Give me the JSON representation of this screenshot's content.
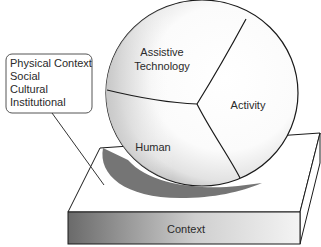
{
  "diagram": {
    "sphere_segments": [
      {
        "id": "assistive-technology",
        "label_lines": [
          "Assistive",
          "Technology"
        ]
      },
      {
        "id": "activity",
        "label_lines": [
          "Activity"
        ]
      },
      {
        "id": "human",
        "label_lines": [
          "Human"
        ]
      }
    ],
    "platform": {
      "label": "Context"
    },
    "callout": {
      "items": [
        "Physical Context",
        "Social",
        "Cultural",
        "Institutional"
      ]
    }
  },
  "colors": {
    "stroke": "#1a1a1a",
    "text": "#2a2a2a",
    "shadow": "#6e6e6e",
    "front_face_dark": "#6a6a6a",
    "front_face_light": "#f2f2f2"
  }
}
